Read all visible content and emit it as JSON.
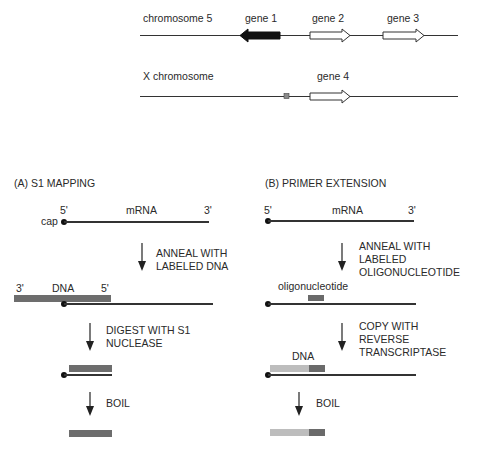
{
  "genome": {
    "chromosome5": {
      "label": "chromosome 5",
      "genes": [
        {
          "name": "gene 1",
          "direction": "left",
          "fill": "#111111"
        },
        {
          "name": "gene 2",
          "direction": "right",
          "fill": "#ffffff"
        },
        {
          "name": "gene 3",
          "direction": "right",
          "fill": "#ffffff"
        }
      ]
    },
    "x_chromosome": {
      "label": "X chromosome",
      "genes": [
        {
          "name": "gene 4",
          "direction": "right",
          "fill": "#ffffff"
        }
      ],
      "element_color": "#8a8a8a"
    }
  },
  "panel_a": {
    "title": "(A) S1 MAPPING",
    "mrna": {
      "five_prime": "5'",
      "label": "mRNA",
      "three_prime": "3'",
      "cap_label": "cap"
    },
    "step1": {
      "line1": "ANNEAL WITH",
      "line2": "LABELED DNA"
    },
    "dna": {
      "three_prime": "3'",
      "label": "DNA",
      "five_prime": "5'"
    },
    "step2": {
      "line1": "DIGEST WITH S1",
      "line2": "NUCLEASE"
    },
    "step3": {
      "line1": "BOIL"
    }
  },
  "panel_b": {
    "title": "(B) PRIMER EXTENSION",
    "mrna": {
      "five_prime": "5'",
      "label": "mRNA",
      "three_prime": "3'"
    },
    "step1": {
      "line1": "ANNEAL WITH",
      "line2": "LABELED",
      "line3": "OLIGONUCLEOTIDE"
    },
    "oligo_label": "oligonucleotide",
    "step2": {
      "line1": "COPY WITH",
      "line2": "REVERSE",
      "line3": "TRANSCRIPTASE"
    },
    "dna_label": "DNA",
    "step3": {
      "line1": "BOIL"
    }
  },
  "colors": {
    "labeled_dna": "#6d6d6d",
    "extended_dna": "#bdbdbd",
    "rna_line": "#333333"
  }
}
